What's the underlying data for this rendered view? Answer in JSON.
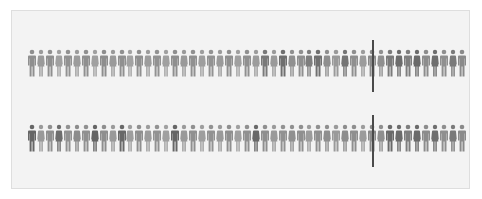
{
  "figure": {
    "rows": [
      {
        "id": "row-1",
        "count": 49,
        "marker_index": 39,
        "shades": [
          "#8f8f8f",
          "#9a9a9a",
          "#8f8f8f",
          "#a0a0a0",
          "#929292",
          "#9c9c9c",
          "#909090",
          "#a0a0a0",
          "#8e8e8e",
          "#9a9a9a",
          "#909090",
          "#a2a2a2",
          "#8f8f8f",
          "#9c9c9c",
          "#929292",
          "#a0a0a0",
          "#8f8f8f",
          "#9a9a9a",
          "#909090",
          "#9e9e9e",
          "#929292",
          "#9a9a9a",
          "#8f8f8f",
          "#a0a0a0",
          "#909090",
          "#9c9c9c",
          "#7a7a7a",
          "#9a9a9a",
          "#6f6f6f",
          "#909090",
          "#8f8f8f",
          "#7e7e7e",
          "#707070",
          "#8f8f8f",
          "#9a9a9a",
          "#747474",
          "#8f8f8f",
          "#9c9c9c",
          "#8a8a8a",
          "#8f8f8f",
          "#7a7a7a",
          "#6c6c6c",
          "#7e7e7e",
          "#6a6a6a",
          "#8c8c8c",
          "#6e6e6e",
          "#8f8f8f",
          "#7a7a7a",
          "#8a8a8a"
        ]
      },
      {
        "id": "row-2",
        "count": 49,
        "marker_index": 39,
        "shades": [
          "#666666",
          "#9a9a9a",
          "#8f8f8f",
          "#6e6e6e",
          "#929292",
          "#8c8c8c",
          "#909090",
          "#646464",
          "#8e8e8e",
          "#9a9a9a",
          "#686868",
          "#9e9e9e",
          "#8f8f8f",
          "#9c9c9c",
          "#929292",
          "#a0a0a0",
          "#666666",
          "#9a9a9a",
          "#909090",
          "#9e9e9e",
          "#929292",
          "#9a9a9a",
          "#8f8f8f",
          "#a0a0a0",
          "#909090",
          "#686868",
          "#8f8f8f",
          "#9a9a9a",
          "#929292",
          "#909090",
          "#8f8f8f",
          "#9c9c9c",
          "#909090",
          "#8f8f8f",
          "#9a9a9a",
          "#8c8c8c",
          "#8f8f8f",
          "#9c9c9c",
          "#8a8a8a",
          "#8f8f8f",
          "#6a6a6a",
          "#6c6c6c",
          "#7e7e7e",
          "#6a6a6a",
          "#8c8c8c",
          "#6e6e6e",
          "#8f8f8f",
          "#7a7a7a",
          "#8a8a8a"
        ]
      }
    ],
    "colors": {
      "background": "#ffffff",
      "panel": "#f3f3f3",
      "panel_border": "#dedede",
      "marker": "#4a4a4a"
    },
    "layout": {
      "spacing_px": 8.95,
      "marker_x": 372
    }
  }
}
